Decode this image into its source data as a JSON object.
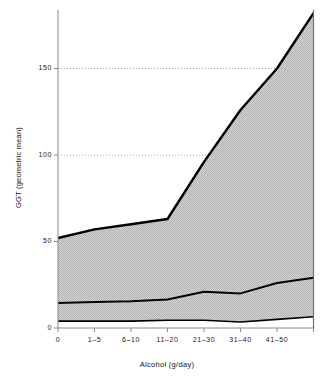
{
  "chart_data": {
    "type": "area",
    "title": "",
    "xlabel": "Alcohol (g/day)",
    "ylabel": "GGT (geometric mean)",
    "categories": [
      "0",
      "1–5",
      "6–10",
      "11–20",
      "21–30",
      "31–40",
      "41–50",
      ""
    ],
    "xtick_labels": [
      "0",
      "1–5",
      "6–10",
      "11–20",
      "21–30",
      "31–40",
      "41–50"
    ],
    "ytick_labels": [
      "0",
      "50",
      "100",
      "150"
    ],
    "ytick_values": [
      0,
      50,
      100,
      150
    ],
    "ylim": [
      0,
      190
    ],
    "grid": false,
    "legend": "none",
    "reference_lines": [
      {
        "value": 150,
        "style": "dotted",
        "extends_to_curve": true
      },
      {
        "value": 100,
        "style": "dotted",
        "extends_to_curve": true
      }
    ],
    "series": [
      {
        "name": "upper",
        "values": [
          52,
          57,
          60,
          63,
          96,
          126,
          150,
          182
        ]
      },
      {
        "name": "middle",
        "values": [
          14.5,
          15,
          15.5,
          16.5,
          21,
          20,
          26,
          29
        ]
      },
      {
        "name": "lower",
        "values": [
          4,
          4,
          4,
          4.5,
          4.5,
          3.5,
          5,
          6.5
        ]
      }
    ],
    "bands": [
      {
        "name": "upper-band",
        "top": "upper",
        "bottom": "middle",
        "fill": "#c9c9c9"
      },
      {
        "name": "lower-band",
        "top": "middle",
        "bottom": "lower",
        "fill": "#c9c9c9"
      }
    ],
    "colors": {
      "band_fill": "#c9c9c9",
      "curve_stroke": "#000000",
      "axis": "#8a8a8a",
      "reference_line": "#9a9a9a",
      "text": "#111111"
    }
  }
}
